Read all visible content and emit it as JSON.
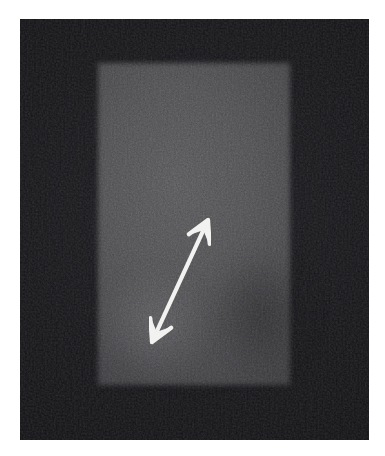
{
  "figure": {
    "kind": "grayscale-imaging-panel",
    "modality_appearance": "monochrome scan / micrograph panel",
    "caption": "",
    "label": ""
  },
  "canvas": {
    "width": 385,
    "height": 456,
    "page_background": "#ffffff",
    "margin_left": 20,
    "margin_top": 19
  },
  "image_field": {
    "name": "dark-imaging-field",
    "x": 20,
    "y": 19,
    "width": 349,
    "height": 421,
    "background_color": "#101013",
    "has_grain": true
  },
  "region_of_interest": {
    "name": "bright-rectangle",
    "x": 98,
    "y": 63,
    "width": 192,
    "height": 322,
    "fill_color": "#46464a",
    "edge": "soft / blurred",
    "brighter_zone": "upper-left",
    "darker_zone": "lower-right"
  },
  "annotations": {
    "arrow": {
      "name": "double-headed-arrow",
      "style": "double-headed",
      "color": "#f2f2f0",
      "head_tip_x": 208,
      "head_tip_y": 220,
      "tail_tip_x": 152,
      "tail_tip_y": 342,
      "stroke_width": 4,
      "orientation_degrees": 65,
      "meaning": "measurement / extent indicator"
    }
  },
  "colors": {
    "frame_dark": "#101013",
    "roi_mid_gray": "#46464a",
    "roi_light_gray": "#4e4e50",
    "annotation_white": "#f2f2f0",
    "page_white": "#ffffff"
  },
  "text_elements": {
    "scale_bar_label": "",
    "panel_letter": "",
    "any_visible_text": "none"
  }
}
